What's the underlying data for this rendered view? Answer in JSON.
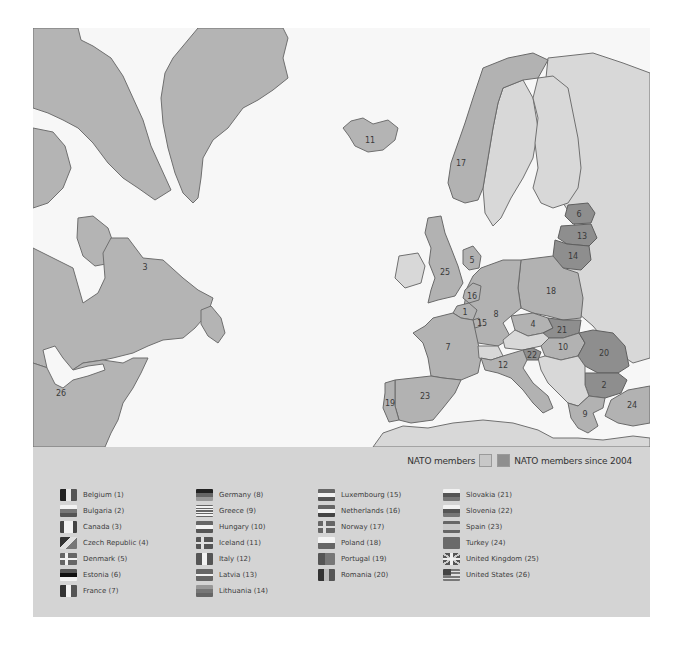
{
  "legend": {
    "nato_members_label": "NATO members",
    "nato_since_2004_label": "NATO members since 2004",
    "colors": {
      "nato_members": "#c8c8c8",
      "nato_since_2004": "#8f8f8f",
      "non_member": "#d8d8d8",
      "water": "#f7f7f7",
      "panel": "#d4d4d4"
    },
    "columns": [
      {
        "items": [
          {
            "label": "Belgium (1)",
            "flag": "belgium-flag-icon"
          },
          {
            "label": "Bulgaria (2)",
            "flag": "bulgaria-flag-icon"
          },
          {
            "label": "Canada (3)",
            "flag": "canada-flag-icon"
          },
          {
            "label": "Czech Republic (4)",
            "flag": "czech-republic-flag-icon"
          },
          {
            "label": "Denmark (5)",
            "flag": "denmark-flag-icon"
          },
          {
            "label": "Estonia (6)",
            "flag": "estonia-flag-icon"
          },
          {
            "label": "France (7)",
            "flag": "france-flag-icon"
          }
        ]
      },
      {
        "items": [
          {
            "label": "Germany (8)",
            "flag": "germany-flag-icon"
          },
          {
            "label": "Greece (9)",
            "flag": "greece-flag-icon"
          },
          {
            "label": "Hungary (10)",
            "flag": "hungary-flag-icon"
          },
          {
            "label": "Iceland (11)",
            "flag": "iceland-flag-icon"
          },
          {
            "label": "Italy (12)",
            "flag": "italy-flag-icon"
          },
          {
            "label": "Latvia (13)",
            "flag": "latvia-flag-icon"
          },
          {
            "label": "Lithuania (14)",
            "flag": "lithuania-flag-icon"
          }
        ]
      },
      {
        "items": [
          {
            "label": "Luxembourg (15)",
            "flag": "luxembourg-flag-icon"
          },
          {
            "label": "Netherlands (16)",
            "flag": "netherlands-flag-icon"
          },
          {
            "label": "Norway (17)",
            "flag": "norway-flag-icon"
          },
          {
            "label": "Poland (18)",
            "flag": "poland-flag-icon"
          },
          {
            "label": "Portugal (19)",
            "flag": "portugal-flag-icon"
          },
          {
            "label": "Romania (20)",
            "flag": "romania-flag-icon"
          }
        ]
      },
      {
        "items": [
          {
            "label": "Slovakia (21)",
            "flag": "slovakia-flag-icon"
          },
          {
            "label": "Slovenia (22)",
            "flag": "slovenia-flag-icon"
          },
          {
            "label": "Spain (23)",
            "flag": "spain-flag-icon"
          },
          {
            "label": "Turkey (24)",
            "flag": "turkey-flag-icon"
          },
          {
            "label": "United Kingdom (25)",
            "flag": "united-kingdom-flag-icon"
          },
          {
            "label": "United States (26)",
            "flag": "united-states-flag-icon"
          }
        ]
      }
    ]
  },
  "map": {
    "labels": {
      "belgium": "1",
      "bulgaria": "2",
      "canada": "3",
      "czech": "4",
      "denmark": "5",
      "estonia": "6",
      "france": "7",
      "germany": "8",
      "greece": "9",
      "hungary": "10",
      "iceland": "11",
      "italy": "12",
      "latvia": "13",
      "lithuania": "14",
      "luxembourg": "15",
      "netherlands": "16",
      "norway": "17",
      "poland": "18",
      "portugal": "19",
      "romania": "20",
      "slovakia": "21",
      "slovenia": "22",
      "spain": "23",
      "turkey": "24",
      "uk": "25",
      "usa": "26"
    }
  }
}
